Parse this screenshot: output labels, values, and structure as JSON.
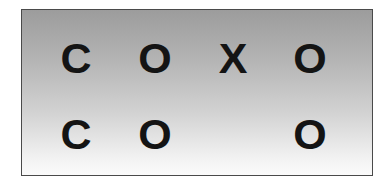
{
  "grid": {
    "rows": [
      {
        "cells": [
          {
            "symbol": "C"
          },
          {
            "symbol": "O"
          },
          {
            "symbol": "X"
          },
          {
            "symbol": "O"
          }
        ]
      },
      {
        "cells": [
          {
            "symbol": "C"
          },
          {
            "symbol": "O"
          },
          {
            "symbol": ""
          },
          {
            "symbol": "O"
          }
        ]
      }
    ]
  },
  "colors": {
    "border": "#4a4a4a",
    "gradient_top": "#9c9c9c",
    "gradient_bottom": "#fbfbfb",
    "text": "#141414"
  }
}
